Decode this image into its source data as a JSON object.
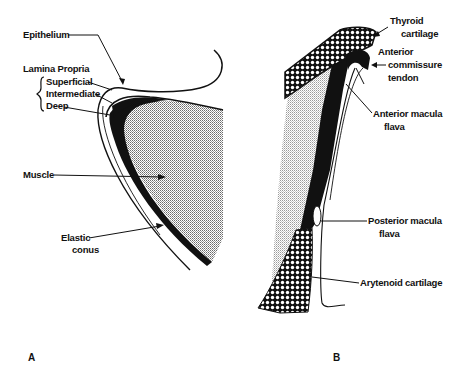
{
  "figure": {
    "panels": [
      {
        "id": "A",
        "label": "A",
        "annotations": {
          "epithelium": "Epithelium",
          "lamina_propria": "Lamina Propria",
          "superficial": "Superficial",
          "intermediate": "Intermediate",
          "deep": "Deep",
          "muscle": "Muscle",
          "elastic_line1": "Elastic",
          "elastic_line2": "conus"
        }
      },
      {
        "id": "B",
        "label": "B",
        "annotations": {
          "thyroid_line1": "Thyroid",
          "thyroid_line2": "cartilage",
          "act_line1": "Anterior",
          "act_line2": "commissure",
          "act_line3": "tendon",
          "amf_line1": "Anterior macula",
          "amf_line2": "flava",
          "pmf_line1": "Posterior macula",
          "pmf_line2": "flava",
          "arytenoid": "Arytenoid cartilage"
        }
      }
    ],
    "colors": {
      "ink": "#111111",
      "background": "#ffffff",
      "stipple": "#9a9a9a"
    }
  }
}
